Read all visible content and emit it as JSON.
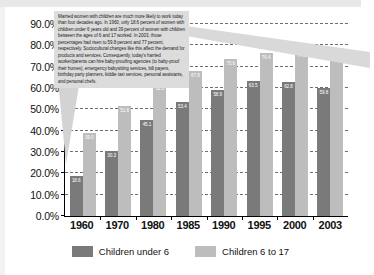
{
  "chart_data": {
    "type": "bar",
    "title": "",
    "xlabel": "",
    "ylabel": "",
    "categories": [
      "1960",
      "1970",
      "1980",
      "1985",
      "1990",
      "1995",
      "2000",
      "2003"
    ],
    "series": [
      {
        "name": "Children under 6",
        "color": "#7a7a7a",
        "values": [
          18.6,
          30.3,
          45.1,
          53.4,
          58.9,
          63.5,
          62.8,
          59.8
        ]
      },
      {
        "name": "Children 6 to 17",
        "color": "#bdbdbd",
        "values": [
          39.0,
          51.6,
          62.0,
          67.8,
          73.6,
          76.4,
          77.2,
          77.8
        ]
      }
    ],
    "ylim": [
      0,
      90
    ],
    "ytick_labels": [
      "0.0%",
      "10.0%",
      "20.0%",
      "30.0%",
      "40.0%",
      "50.0%",
      "60.0%",
      "70.0%",
      "80.0%",
      "90.0%"
    ],
    "ytick_values": [
      0,
      10,
      20,
      30,
      40,
      50,
      60,
      70,
      80,
      90
    ],
    "grid": true,
    "legend_position": "bottom"
  },
  "callout": {
    "text": "Married women with children are much more likely to work today than four decades ago. In 1960, only 18.6 percent of women with children under 6 years old and 39 percent of women with children between the ages of 6 and 17 worked. In 2003, those percentages had risen to 59.8 percent and 77 percent, respectively.  Sociocultural changes like this affect the demand for products and services. Consequently, today's harried worker/parents can hire baby-proofing agencies (to baby-proof their homes), emergency babysitting services, bill payers, birthday party planners, kiddie taxi services, personal assistants, and personal chefs.",
    "background": "#dcdcdc"
  }
}
